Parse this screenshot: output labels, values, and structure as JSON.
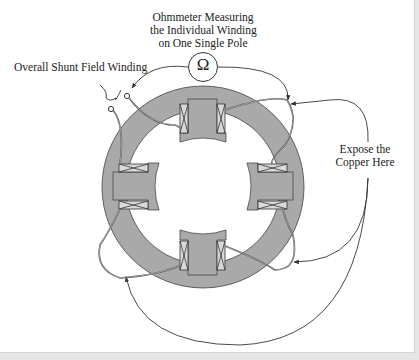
{
  "diagram": {
    "title_lines": [
      "Ohmmeter Measuring",
      "the Individual Winding",
      "on One Single Pole"
    ],
    "ohmmeter_symbol": "Ω",
    "shunt_label": "Overall Shunt Field Winding",
    "expose_label_lines": [
      "Expose the",
      "Copper Here"
    ],
    "colors": {
      "background": "#ffffff",
      "frame_border": "#d4d4d4",
      "iron": "#a9a9a9",
      "coil_fill": "#d9d9d9",
      "wire": "#333333",
      "text": "#222222"
    },
    "poles": [
      "top",
      "right",
      "bottom",
      "left"
    ],
    "icons": [
      "ohmmeter-icon",
      "terminal-icon",
      "arrow-icon",
      "brace-icon"
    ]
  }
}
